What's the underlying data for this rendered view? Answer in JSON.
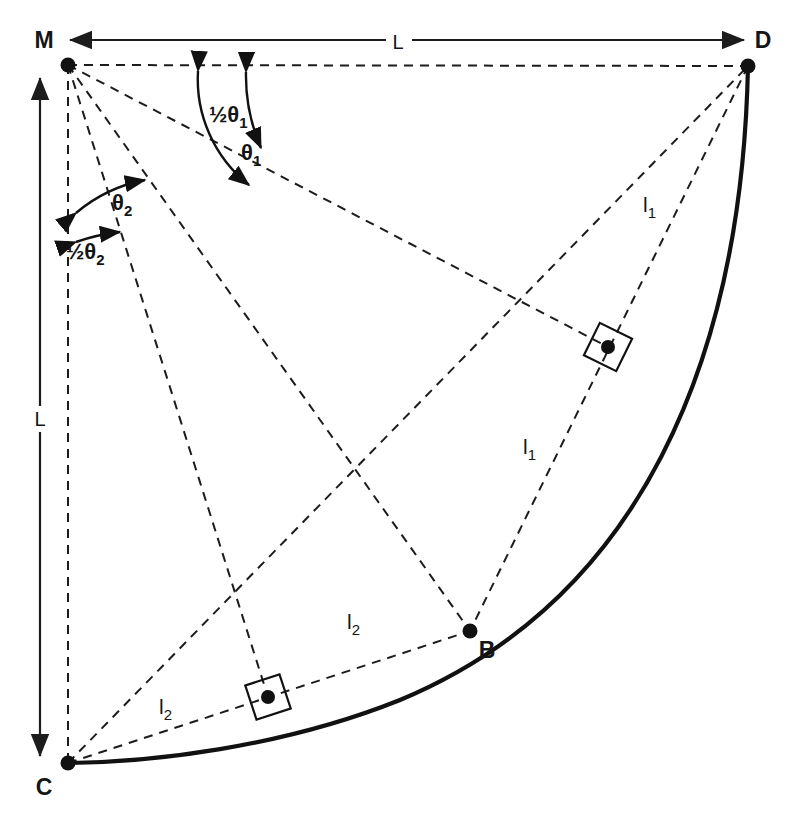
{
  "figure": {
    "background_color": "#ffffff",
    "line_color": "#1c1c1c",
    "curve_color": "#111111"
  },
  "points": {
    "M": {
      "label": "M",
      "x": 68,
      "y": 65,
      "label_x": 44,
      "label_y": 48
    },
    "D": {
      "label": "D",
      "x": 748,
      "y": 66,
      "label_x": 757,
      "label_y": 48
    },
    "C": {
      "label": "C",
      "x": 68,
      "y": 763,
      "label_x": 44,
      "label_y": 795
    },
    "B": {
      "label": "B",
      "x": 470,
      "y": 631,
      "label_x": 481,
      "label_y": 658
    },
    "P1": {
      "label": "",
      "x": 608,
      "y": 347
    },
    "P2": {
      "label": "",
      "x": 268,
      "y": 697
    }
  },
  "dimensions": {
    "top": {
      "label": "L",
      "x": 398,
      "y": 52
    },
    "left": {
      "label": "L",
      "x": 42,
      "y": 418
    }
  },
  "angles": [
    {
      "name": "theta1",
      "label": "θ1",
      "base": "θ",
      "subscript": "1",
      "x": 250,
      "y": 152
    },
    {
      "name": "half-theta1",
      "label": "½θ1",
      "prefix": "½",
      "base": "θ",
      "subscript": "1",
      "x": 219,
      "y": 115
    },
    {
      "name": "theta2",
      "label": "θ2",
      "base": "θ",
      "subscript": "2",
      "x": 118,
      "y": 204
    },
    {
      "name": "half-theta2",
      "label": "½θ2",
      "prefix": "½",
      "base": "θ",
      "subscript": "2",
      "x": 74,
      "y": 250
    }
  ],
  "segments": [
    {
      "name": "l1-upper",
      "base": "l",
      "subscript": "1",
      "x": 648,
      "y": 205
    },
    {
      "name": "l1-lower",
      "base": "l",
      "subscript": "1",
      "x": 528,
      "y": 447
    },
    {
      "name": "l2-upper",
      "base": "l",
      "subscript": "2",
      "x": 352,
      "y": 622
    },
    {
      "name": "l2-lower",
      "base": "l",
      "subscript": "2",
      "x": 164,
      "y": 707
    }
  ]
}
